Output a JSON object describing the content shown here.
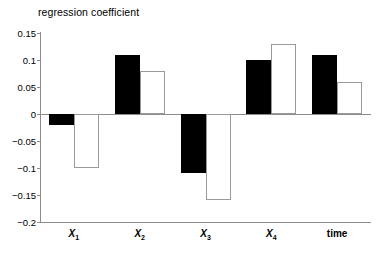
{
  "chart_data": {
    "type": "bar",
    "title": "regression coefficient",
    "xlabel": "",
    "ylabel": "regression coefficient",
    "ylim": [
      -0.2,
      0.15
    ],
    "yticks": [
      0.15,
      0.1,
      0.05,
      0,
      -0.05,
      -0.1,
      -0.15,
      -0.2
    ],
    "ytick_labels": [
      "0.15",
      "0.1",
      "0.05",
      "0",
      "−0.05",
      "−0.1",
      "−0.15",
      "−0.2"
    ],
    "categories": [
      "X1",
      "X2",
      "X3",
      "X4",
      "time"
    ],
    "category_labels": [
      "X",
      "X",
      "X",
      "X",
      "time"
    ],
    "category_subscripts": [
      "1",
      "2",
      "3",
      "4",
      ""
    ],
    "grid": false,
    "legend": "none",
    "series": [
      {
        "name": "black",
        "fill": "#000000",
        "values": [
          -0.02,
          0.11,
          -0.11,
          0.1,
          0.11
        ]
      },
      {
        "name": "white",
        "fill": "#ffffff",
        "values": [
          -0.1,
          0.08,
          -0.16,
          0.13,
          0.06
        ]
      }
    ]
  },
  "colors": {
    "background": "#ffffff",
    "axis": "#8c8c8c",
    "text": "#000000",
    "bar_black": "#000000",
    "bar_white_fill": "#ffffff",
    "bar_white_stroke": "#9a9a9a"
  },
  "axis": {
    "title": "regression coefficient"
  }
}
